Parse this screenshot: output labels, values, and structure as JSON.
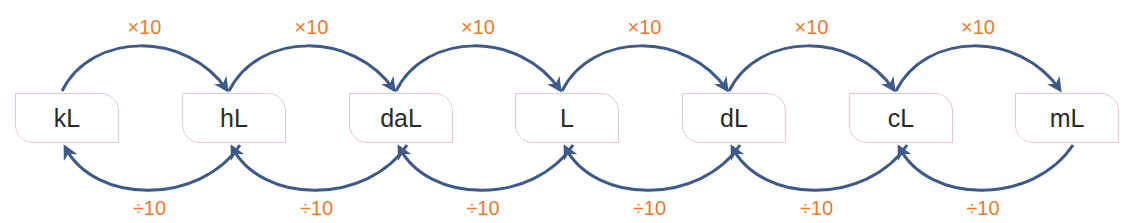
{
  "diagram": {
    "title": "",
    "units": [
      {
        "label": "kL",
        "x": 15
      },
      {
        "label": "hL",
        "x": 182
      },
      {
        "label": "daL",
        "x": 349
      },
      {
        "label": "L",
        "x": 515
      },
      {
        "label": "dL",
        "x": 682
      },
      {
        "label": "cL",
        "x": 849
      },
      {
        "label": "mL",
        "x": 1015
      }
    ],
    "box": {
      "y": 93,
      "width": 104,
      "height": 50
    },
    "multiply_label": "×10",
    "divide_label": "÷10",
    "colors": {
      "arrow": "#3d5a8a",
      "label": "#f07a30",
      "box_border": "#e6c9cb",
      "text": "#2a2a2a"
    }
  }
}
